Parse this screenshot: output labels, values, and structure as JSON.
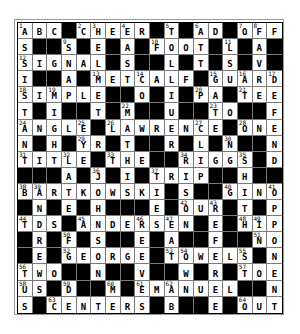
{
  "puzzle": {
    "rows": 18,
    "cols": 18,
    "colors": {
      "block": "#000000",
      "cell": "#ffffff",
      "text": "#000000"
    },
    "grid": [
      [
        "A",
        "B",
        "C",
        "#",
        "C",
        "H",
        "E",
        "E",
        "R",
        "#",
        "T",
        "#",
        "A",
        "D",
        "#",
        "O",
        "F",
        "F"
      ],
      [
        "S",
        "#",
        "#",
        "S",
        "#",
        "E",
        "#",
        "A",
        "#",
        "F",
        "O",
        "O",
        "T",
        "#",
        "L",
        "#",
        "A",
        "#"
      ],
      [
        "S",
        "I",
        "G",
        "N",
        "A",
        "L",
        "#",
        "S",
        "#",
        "#",
        "L",
        "#",
        "T",
        "#",
        "S",
        "#",
        "V",
        "#"
      ],
      [
        "I",
        "#",
        "#",
        "A",
        "#",
        "M",
        "E",
        "T",
        "C",
        "A",
        "L",
        "F",
        "#",
        "G",
        "U",
        "A",
        "R",
        "D"
      ],
      [
        "S",
        "I",
        "M",
        "P",
        "L",
        "E",
        "#",
        "#",
        "O",
        "#",
        "I",
        "#",
        "P",
        "A",
        "#",
        "T",
        "E",
        "E"
      ],
      [
        "T",
        "#",
        "I",
        "#",
        "#",
        "T",
        "#",
        "M",
        "#",
        "#",
        "U",
        "#",
        "#",
        "T",
        "O",
        "#",
        "#",
        "F"
      ],
      [
        "A",
        "N",
        "G",
        "L",
        "E",
        "#",
        "L",
        "A",
        "W",
        "R",
        "E",
        "N",
        "C",
        "E",
        "#",
        "O",
        "N",
        "E"
      ],
      [
        "N",
        "#",
        "H",
        "#",
        "Y",
        "R",
        "#",
        "T",
        "#",
        "#",
        "R",
        "#",
        "L",
        "#",
        "N",
        "#",
        "#",
        "N"
      ],
      [
        "T",
        "I",
        "T",
        "L",
        "E",
        "#",
        "T",
        "H",
        "E",
        "#",
        "#",
        "R",
        "I",
        "G",
        "G",
        "S",
        "#",
        "D"
      ],
      [
        "#",
        "#",
        "#",
        "A",
        "#",
        "J",
        "#",
        "I",
        "#",
        "T",
        "R",
        "I",
        "P",
        "#",
        "#",
        "H",
        "#",
        "#"
      ],
      [
        "B",
        "A",
        "R",
        "T",
        "K",
        "O",
        "W",
        "S",
        "K",
        "I",
        "#",
        "S",
        "#",
        "#",
        "G",
        "I",
        "N",
        "O"
      ],
      [
        "#",
        "N",
        "#",
        "E",
        "#",
        "H",
        "#",
        "#",
        "#",
        "E",
        "#",
        "O",
        "U",
        "R",
        "#",
        "T",
        "#",
        "P"
      ],
      [
        "T",
        "D",
        "S",
        "#",
        "A",
        "N",
        "D",
        "E",
        "R",
        "S",
        "E",
        "N",
        "#",
        "E",
        "#",
        "H",
        "I",
        "P"
      ],
      [
        "#",
        "R",
        "#",
        "F",
        "#",
        "S",
        "#",
        "#",
        "E",
        "#",
        "A",
        "#",
        "#",
        "F",
        "#",
        "#",
        "N",
        "O"
      ],
      [
        "#",
        "E",
        "#",
        "G",
        "E",
        "O",
        "R",
        "G",
        "E",
        "#",
        "T",
        "O",
        "W",
        "E",
        "L",
        "S",
        "#",
        "N"
      ],
      [
        "T",
        "W",
        "O",
        "#",
        "#",
        "N",
        "#",
        "#",
        "V",
        "#",
        "#",
        "W",
        "#",
        "R",
        "#",
        "T",
        "O",
        "E"
      ],
      [
        "U",
        "S",
        "#",
        "D",
        "#",
        "#",
        "M",
        "#",
        "E",
        "M",
        "A",
        "N",
        "U",
        "E",
        "L",
        "#",
        "#",
        "N"
      ],
      [
        "S",
        "#",
        "C",
        "E",
        "N",
        "T",
        "E",
        "R",
        "S",
        "#",
        "B",
        "#",
        "#",
        "E",
        "#",
        "O",
        "U",
        "T"
      ]
    ],
    "numbers": [
      {
        "row": 0,
        "col": 0,
        "n": "1"
      },
      {
        "row": 0,
        "col": 4,
        "n": "2"
      },
      {
        "row": 0,
        "col": 5,
        "n": "3"
      },
      {
        "row": 0,
        "col": 7,
        "n": "4"
      },
      {
        "row": 0,
        "col": 10,
        "n": "5"
      },
      {
        "row": 0,
        "col": 12,
        "n": "6"
      },
      {
        "row": 0,
        "col": 15,
        "n": "7"
      },
      {
        "row": 0,
        "col": 16,
        "n": "8"
      },
      {
        "row": 1,
        "col": 3,
        "n": "9"
      },
      {
        "row": 1,
        "col": 9,
        "n": "10"
      },
      {
        "row": 1,
        "col": 14,
        "n": "11"
      },
      {
        "row": 2,
        "col": 0,
        "n": "12"
      },
      {
        "row": 3,
        "col": 5,
        "n": "13"
      },
      {
        "row": 3,
        "col": 8,
        "n": "14"
      },
      {
        "row": 3,
        "col": 13,
        "n": "15"
      },
      {
        "row": 3,
        "col": 15,
        "n": "16"
      },
      {
        "row": 3,
        "col": 17,
        "n": "17"
      },
      {
        "row": 4,
        "col": 0,
        "n": "18"
      },
      {
        "row": 4,
        "col": 2,
        "n": "19"
      },
      {
        "row": 4,
        "col": 12,
        "n": "20"
      },
      {
        "row": 4,
        "col": 15,
        "n": "21"
      },
      {
        "row": 5,
        "col": 7,
        "n": "22"
      },
      {
        "row": 5,
        "col": 13,
        "n": "23"
      },
      {
        "row": 6,
        "col": 0,
        "n": "24"
      },
      {
        "row": 6,
        "col": 4,
        "n": "25"
      },
      {
        "row": 6,
        "col": 6,
        "n": "26"
      },
      {
        "row": 6,
        "col": 12,
        "n": "27"
      },
      {
        "row": 6,
        "col": 15,
        "n": "28"
      },
      {
        "row": 7,
        "col": 4,
        "n": "29"
      },
      {
        "row": 7,
        "col": 14,
        "n": "30"
      },
      {
        "row": 8,
        "col": 0,
        "n": "31"
      },
      {
        "row": 8,
        "col": 3,
        "n": "32"
      },
      {
        "row": 8,
        "col": 6,
        "n": "33"
      },
      {
        "row": 8,
        "col": 11,
        "n": "34"
      },
      {
        "row": 8,
        "col": 15,
        "n": "35"
      },
      {
        "row": 9,
        "col": 5,
        "n": "36"
      },
      {
        "row": 9,
        "col": 9,
        "n": "37"
      },
      {
        "row": 10,
        "col": 0,
        "n": "38"
      },
      {
        "row": 10,
        "col": 1,
        "n": "39"
      },
      {
        "row": 10,
        "col": 14,
        "n": "40"
      },
      {
        "row": 10,
        "col": 17,
        "n": "41"
      },
      {
        "row": 11,
        "col": 11,
        "n": "42"
      },
      {
        "row": 11,
        "col": 13,
        "n": "43"
      },
      {
        "row": 12,
        "col": 0,
        "n": "44"
      },
      {
        "row": 12,
        "col": 4,
        "n": "45"
      },
      {
        "row": 12,
        "col": 8,
        "n": "46"
      },
      {
        "row": 12,
        "col": 10,
        "n": "47"
      },
      {
        "row": 12,
        "col": 15,
        "n": "48"
      },
      {
        "row": 12,
        "col": 16,
        "n": "49"
      },
      {
        "row": 13,
        "col": 3,
        "n": "50"
      },
      {
        "row": 13,
        "col": 16,
        "n": "51"
      },
      {
        "row": 14,
        "col": 3,
        "n": "52"
      },
      {
        "row": 14,
        "col": 10,
        "n": "53"
      },
      {
        "row": 14,
        "col": 11,
        "n": "54"
      },
      {
        "row": 14,
        "col": 15,
        "n": "55"
      },
      {
        "row": 15,
        "col": 0,
        "n": "56"
      },
      {
        "row": 15,
        "col": 15,
        "n": "57"
      },
      {
        "row": 16,
        "col": 0,
        "n": "58"
      },
      {
        "row": 16,
        "col": 3,
        "n": "59"
      },
      {
        "row": 16,
        "col": 6,
        "n": "60"
      },
      {
        "row": 16,
        "col": 8,
        "n": "61"
      },
      {
        "row": 16,
        "col": 10,
        "n": "62"
      },
      {
        "row": 17,
        "col": 2,
        "n": "63"
      },
      {
        "row": 17,
        "col": 15,
        "n": "64"
      }
    ]
  }
}
